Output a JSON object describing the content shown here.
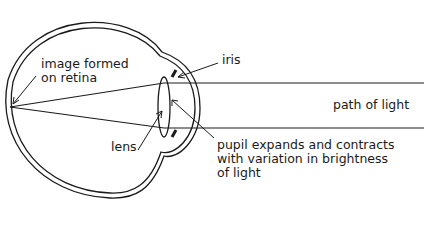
{
  "diagram": {
    "labels": {
      "image_formed": "image formed\non retina",
      "iris": "iris",
      "path_of_light": "path of light",
      "lens": "lens",
      "pupil": "pupil expands and contracts\nwith variation in brightness\nof light"
    },
    "colors": {
      "stroke": "#1a1a1a",
      "background": "#ffffff"
    }
  }
}
